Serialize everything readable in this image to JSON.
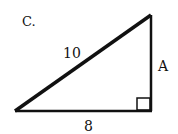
{
  "diagram": {
    "type": "right-triangle",
    "corner_label": "C.",
    "hypotenuse_label": "10",
    "vertical_leg_label": "A",
    "base_label": "8",
    "colors": {
      "stroke": "#111111",
      "background": "#ffffff"
    }
  }
}
